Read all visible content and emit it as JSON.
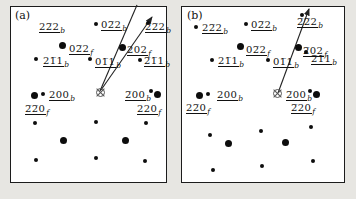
{
  "figure": {
    "colors": {
      "background": "#e7e6e2",
      "panel": "#ffffff",
      "ink": "#111111",
      "arrow": "#222222",
      "beam_marker": "#555555"
    }
  },
  "panels": [
    {
      "id": "a",
      "tag": "(a)",
      "labels": [
        {
          "text": "22̅2",
          "sub": "b",
          "x": 39,
          "y": 21
        },
        {
          "text": "02̅2",
          "sub": "b",
          "x": 101,
          "y": 19
        },
        {
          "text": "2̅2̅2",
          "sub": "b",
          "x": 145,
          "y": 21
        },
        {
          "text": "02̅2",
          "sub": "f",
          "x": 69,
          "y": 43
        },
        {
          "text": "202",
          "sub": "f",
          "x": 127,
          "y": 44
        },
        {
          "text": "21̅1",
          "sub": "b",
          "x": 43,
          "y": 55
        },
        {
          "text": "01̅1",
          "sub": "b",
          "x": 95,
          "y": 56
        },
        {
          "text": "2̅1̅1",
          "sub": "b",
          "x": 144,
          "y": 55
        },
        {
          "text": "200",
          "sub": "b",
          "x": 49,
          "y": 89
        },
        {
          "text": "2̅00",
          "sub": "b",
          "x": 125,
          "y": 89
        },
        {
          "text": "2̅2̅0",
          "sub": "f",
          "x": 25,
          "y": 103
        },
        {
          "text": "220",
          "sub": "f",
          "x": 137,
          "y": 103
        }
      ],
      "spots_small": [
        [
          96,
          24
        ],
        [
          148,
          23
        ],
        [
          36,
          59
        ],
        [
          90,
          59
        ],
        [
          140,
          60
        ],
        [
          43,
          94
        ],
        [
          151,
          91
        ],
        [
          35,
          123
        ],
        [
          96,
          122
        ],
        [
          146,
          123
        ],
        [
          36,
          160
        ],
        [
          96,
          158
        ],
        [
          145,
          161
        ]
      ],
      "spots_large": [
        [
          62,
          45
        ],
        [
          122,
          47
        ],
        [
          34,
          95
        ],
        [
          157,
          94
        ],
        [
          63,
          140
        ],
        [
          125,
          140
        ]
      ],
      "beam": {
        "x": 100,
        "y": 92
      },
      "arrows": [
        {
          "x1": 100,
          "y1": 91,
          "x2": 137,
          "y2": 5,
          "head": false
        },
        {
          "x1": 101,
          "y1": 90,
          "x2": 152,
          "y2": 17,
          "head": true
        }
      ]
    },
    {
      "id": "b",
      "tag": "(b)",
      "labels": [
        {
          "text": "22̅2",
          "sub": "b",
          "x": 202,
          "y": 22
        },
        {
          "text": "02̅2",
          "sub": "b",
          "x": 251,
          "y": 19
        },
        {
          "text": "2̅2̅2",
          "sub": "b",
          "x": 297,
          "y": 16
        },
        {
          "text": "02̅2",
          "sub": "f",
          "x": 246,
          "y": 44
        },
        {
          "text": "2̅02",
          "sub": "f",
          "x": 303,
          "y": 45
        },
        {
          "text": "21̅1",
          "sub": "b",
          "x": 218,
          "y": 55
        },
        {
          "text": "01̅1",
          "sub": "b",
          "x": 273,
          "y": 56
        },
        {
          "text": "2̅1̅1",
          "sub": "b",
          "x": 311,
          "y": 53
        },
        {
          "text": "200",
          "sub": "b",
          "x": 217,
          "y": 89
        },
        {
          "text": "2̅00",
          "sub": "b",
          "x": 286,
          "y": 89
        },
        {
          "text": "22̅0",
          "sub": "f",
          "x": 186,
          "y": 102
        },
        {
          "text": "2̅20",
          "sub": "f",
          "x": 291,
          "y": 102
        }
      ],
      "spots_small": [
        [
          196,
          27
        ],
        [
          246,
          24
        ],
        [
          302,
          15
        ],
        [
          212,
          60
        ],
        [
          268,
          60
        ],
        [
          306,
          52
        ],
        [
          208,
          94
        ],
        [
          310,
          91
        ],
        [
          210,
          135
        ],
        [
          261,
          131
        ],
        [
          311,
          127
        ],
        [
          213,
          170
        ],
        [
          262,
          166
        ],
        [
          313,
          161
        ]
      ],
      "spots_large": [
        [
          240,
          46
        ],
        [
          298,
          47
        ],
        [
          199,
          95
        ],
        [
          316,
          94
        ],
        [
          228,
          143
        ],
        [
          285,
          142
        ]
      ],
      "beam": {
        "x": 277,
        "y": 93
      },
      "arrows": [
        {
          "x1": 278,
          "y1": 93,
          "x2": 309,
          "y2": 9,
          "head": true
        }
      ]
    }
  ]
}
